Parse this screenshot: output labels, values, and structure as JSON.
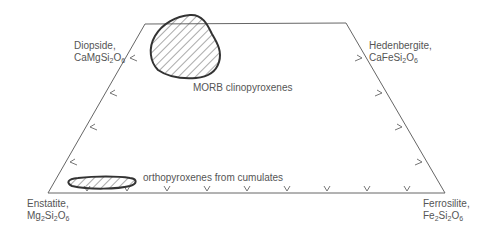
{
  "diagram": {
    "corners": {
      "top_left": {
        "name": "Diopside,",
        "formula": [
          "CaMgSi",
          "2",
          "O",
          "6"
        ]
      },
      "top_right": {
        "name": "Hedenbergite,",
        "formula": [
          "CaFeSi",
          "2",
          "O",
          "6"
        ]
      },
      "bottom_left": {
        "name": "Enstatite,",
        "formula": [
          "Mg",
          "2",
          "Si",
          "2",
          "O",
          "6"
        ]
      },
      "bottom_right": {
        "name": "Ferrosilite,",
        "formula": [
          "Fe",
          "2",
          "Si",
          "2",
          "O",
          "6"
        ]
      }
    },
    "fields": [
      {
        "label": "MORB clinopyroxenes",
        "fill": "hatched"
      },
      {
        "label": "orthopyroxenes from cumulates",
        "fill": "hatched"
      }
    ],
    "colors": {
      "outline": "#555555",
      "field_outline": "#333333",
      "hatch": "#555555",
      "text": "#555555"
    }
  }
}
